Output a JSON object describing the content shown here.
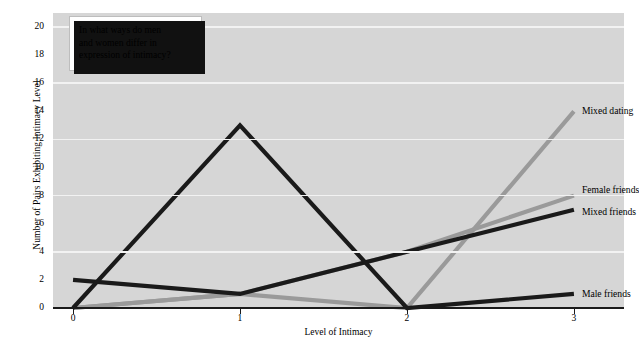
{
  "chart_data": {
    "type": "line",
    "title": "",
    "xlabel": "Level of Intimacy",
    "ylabel": "Number of Pairs Exhibiting Intimacy Level",
    "x": [
      0,
      1,
      2,
      3
    ],
    "xticklabels": [
      "0",
      "1",
      "2",
      "3"
    ],
    "yticklabels": [
      "0",
      "2",
      "4",
      "6",
      "8",
      "10",
      "12",
      "14",
      "16",
      "18",
      "20"
    ],
    "yticks": [
      0,
      2,
      4,
      6,
      8,
      10,
      12,
      14,
      16,
      18,
      20
    ],
    "gridlines": [
      4,
      8,
      12,
      16,
      20
    ],
    "ylim": [
      0,
      21
    ],
    "xlim": [
      -0.12,
      3.3
    ],
    "grid": true,
    "legend_position": "right-inline-labels",
    "plot_background": "#d6d6d6",
    "series": [
      {
        "name": "Mixed dating",
        "values": [
          0,
          1,
          0,
          14
        ],
        "color": "#9a9a9a",
        "width": 4.2
      },
      {
        "name": "Female friends",
        "values": [
          0,
          1,
          4,
          8
        ],
        "color": "#9a9a9a",
        "width": 4.2
      },
      {
        "name": "Mixed friends",
        "values": [
          2,
          1,
          4,
          7
        ],
        "color": "#1a1a1a",
        "width": 4.2
      },
      {
        "name": "Male friends",
        "values": [
          0,
          13,
          0,
          1
        ],
        "color": "#1a1a1a",
        "width": 4.2
      }
    ],
    "annotations": [
      {
        "name": "question-callout",
        "text": "In what ways do men and women differ in expression of intimacy?"
      }
    ]
  },
  "callout": {
    "line1": "In what ways do men",
    "line2": "and women differ in",
    "line3": "expression of intimacy?"
  },
  "labels": {
    "mixed_dating": "Mixed dating",
    "female_friends": "Female friends",
    "mixed_friends": "Mixed friends",
    "male_friends": "Male friends"
  },
  "axes": {
    "y_title": "Number of Pairs Exhibiting Intimacy Level",
    "x_title": "Level of Intimacy",
    "y_0": "0",
    "y_2": "2",
    "y_4": "4",
    "y_6": "6",
    "y_8": "8",
    "y_10": "10",
    "y_12": "12",
    "y_14": "14",
    "y_16": "16",
    "y_18": "18",
    "y_20": "20",
    "x_0": "0",
    "x_1": "1",
    "x_2": "2",
    "x_3": "3"
  },
  "caption": ""
}
